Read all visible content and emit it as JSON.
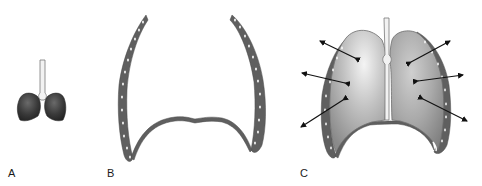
{
  "figure": {
    "panels": [
      {
        "id": "A",
        "label": "A",
        "description": "lungs with trachea, small"
      },
      {
        "id": "B",
        "label": "B",
        "description": "chest wall and diaphragm"
      },
      {
        "id": "C",
        "label": "C",
        "description": "lungs inside chest wall with outward arrows"
      }
    ],
    "colors": {
      "lung_dark": "#3a3a3a",
      "lung_light": "#e6e6e6",
      "lung_mid": "#9a9a9a",
      "chest_wall": "#5f5f5f",
      "rib_marks": "#ffffff",
      "trachea": "#f2f2f2",
      "trachea_outline": "#7a7a7a",
      "arrow": "#111111",
      "background": "#ffffff"
    }
  }
}
